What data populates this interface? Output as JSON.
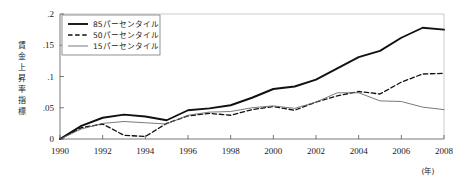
{
  "chart_data": {
    "type": "line",
    "title": "",
    "xlabel": "(年)",
    "ylabel": "賃金上昇率指標",
    "xlim": [
      1990,
      2008
    ],
    "ylim": [
      0,
      0.2
    ],
    "grid": false,
    "legend_position": "top-left",
    "xticks": [
      "1990",
      "1992",
      "1994",
      "1996",
      "1998",
      "2000",
      "2002",
      "2004",
      "2006",
      "2008"
    ],
    "yticks": [
      "0",
      ".05",
      ".1",
      ".15",
      ".2"
    ],
    "ytick_values": [
      0,
      0.05,
      0.1,
      0.15,
      0.2
    ],
    "x": [
      1990,
      1991,
      1992,
      1993,
      1994,
      1995,
      1996,
      1997,
      1998,
      1999,
      2000,
      2001,
      2002,
      2003,
      2004,
      2005,
      2006,
      2007,
      2008
    ],
    "series": [
      {
        "name": "85パーセンタイル",
        "style": "solid",
        "color": "#111111",
        "width": 1.9,
        "values": [
          0.0,
          0.021,
          0.034,
          0.039,
          0.036,
          0.03,
          0.046,
          0.049,
          0.054,
          0.066,
          0.08,
          0.084,
          0.095,
          0.113,
          0.131,
          0.141,
          0.162,
          0.178,
          0.175
        ]
      },
      {
        "name": "50パーセンタイル",
        "style": "dashed",
        "color": "#111111",
        "width": 1.3,
        "values": [
          0.0,
          0.018,
          0.024,
          0.006,
          0.004,
          0.025,
          0.037,
          0.041,
          0.038,
          0.047,
          0.052,
          0.046,
          0.059,
          0.069,
          0.076,
          0.072,
          0.091,
          0.104,
          0.105
        ]
      },
      {
        "name": "15パーセンタイル",
        "style": "thin",
        "color": "#6b6b6b",
        "width": 0.9,
        "values": [
          0.0,
          0.016,
          0.025,
          0.028,
          0.026,
          0.024,
          0.038,
          0.043,
          0.044,
          0.05,
          0.053,
          0.049,
          0.059,
          0.074,
          0.074,
          0.061,
          0.06,
          0.051,
          0.047
        ]
      }
    ]
  },
  "axis": {
    "y_label_chars": [
      "賃",
      "金",
      "上",
      "昇",
      "率",
      "指",
      "標"
    ],
    "x_unit": "(年)"
  }
}
